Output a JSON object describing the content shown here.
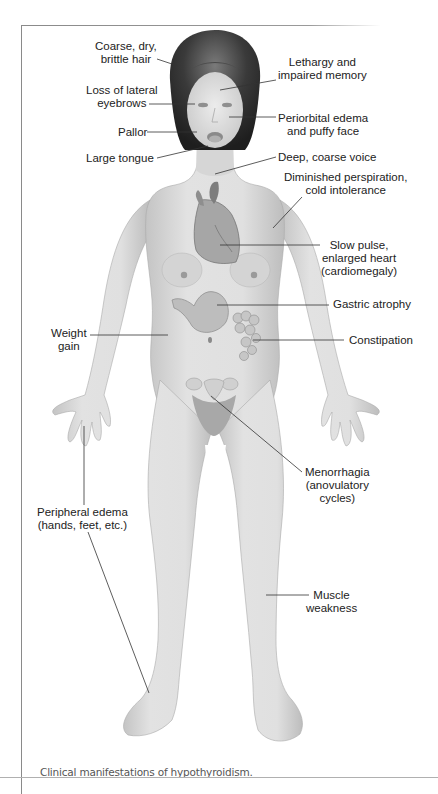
{
  "caption": "Clinical manifestations of hypothyroidism.",
  "labels": {
    "hair": [
      "Coarse, dry,",
      "brittle hair"
    ],
    "lethargy": [
      "Lethargy and",
      "impaired memory"
    ],
    "eyebrows": [
      "Loss of lateral",
      "eyebrows"
    ],
    "periorbital": [
      "Periorbital edema",
      "and puffy face"
    ],
    "pallor": "Pallor",
    "tongue": "Large tongue",
    "voice": "Deep, coarse voice",
    "perspiration": [
      "Diminished perspiration,",
      "cold intolerance"
    ],
    "pulse": [
      "Slow pulse,",
      "enlarged heart",
      "(cardiomegaly)"
    ],
    "gastric": "Gastric atrophy",
    "weight": [
      "Weight",
      "gain"
    ],
    "constipation": "Constipation",
    "menorrhagia": [
      "Menorrhagia",
      "(anovulatory",
      "cycles)"
    ],
    "edema": [
      "Peripheral edema",
      "(hands, feet, etc.)"
    ],
    "muscle": [
      "Muscle",
      "weakness"
    ]
  },
  "colors": {
    "skin": "#d9d9d9",
    "skin_shadow": "#b8b8b8",
    "hair": "#2e2e2e",
    "organ": "#9a9a9a",
    "leader_line": "#333333",
    "frame": "#8a8a8a"
  }
}
